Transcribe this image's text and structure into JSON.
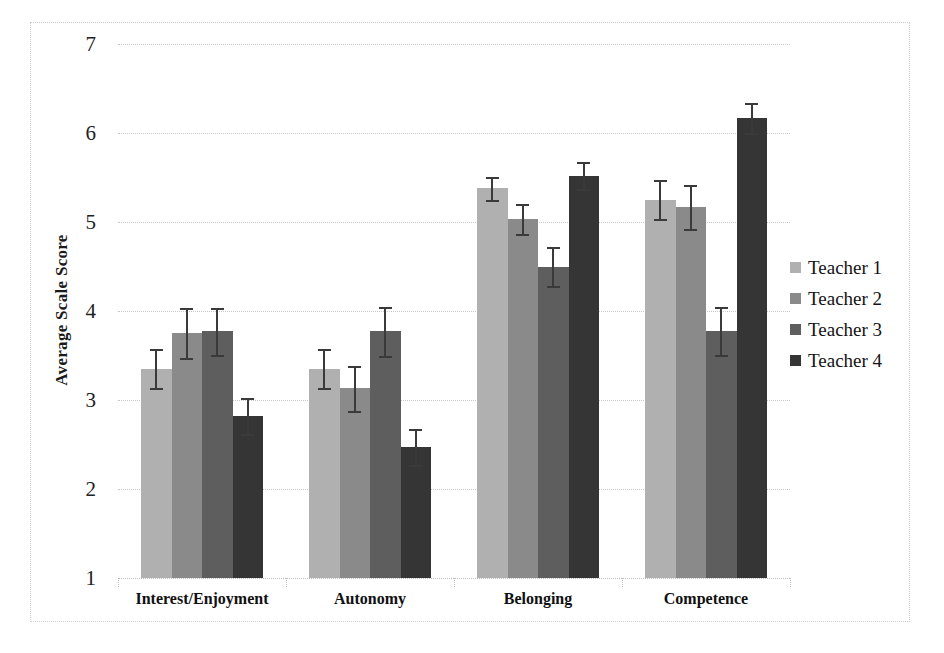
{
  "chart_data": {
    "type": "bar",
    "title": "",
    "xlabel": "",
    "ylabel": "Average Scale Score",
    "ylim": [
      1,
      7
    ],
    "yticks": [
      1,
      2,
      3,
      4,
      5,
      6,
      7
    ],
    "ytick_labels": [
      "1",
      "2",
      "3",
      "4",
      "5",
      "6",
      "7"
    ],
    "grid": true,
    "legend_position": "right",
    "categories": [
      "Interest/Enjoyment",
      "Autonomy",
      "Belonging",
      "Competence"
    ],
    "series": [
      {
        "name": "Teacher 1",
        "color": "#b0b0b0",
        "values": [
          3.35,
          3.35,
          5.38,
          5.25
        ],
        "errors": [
          0.22,
          0.22,
          0.13,
          0.22
        ]
      },
      {
        "name": "Teacher 2",
        "color": "#8a8a8a",
        "values": [
          3.75,
          3.13,
          5.03,
          5.17
        ],
        "errors": [
          0.28,
          0.25,
          0.17,
          0.25
        ]
      },
      {
        "name": "Teacher 3",
        "color": "#5e5e5e",
        "values": [
          3.77,
          3.77,
          4.5,
          3.78
        ],
        "errors": [
          0.26,
          0.28,
          0.22,
          0.27
        ]
      },
      {
        "name": "Teacher 4",
        "color": "#353535",
        "values": [
          2.82,
          2.47,
          5.52,
          6.17
        ],
        "errors": [
          0.2,
          0.2,
          0.15,
          0.17
        ]
      }
    ]
  },
  "axis": {
    "y_title": "Average Scale Score"
  },
  "legend": {
    "entries": [
      {
        "label": "Teacher 1"
      },
      {
        "label": "Teacher 2"
      },
      {
        "label": "Teacher 3"
      },
      {
        "label": "Teacher 4"
      }
    ]
  }
}
